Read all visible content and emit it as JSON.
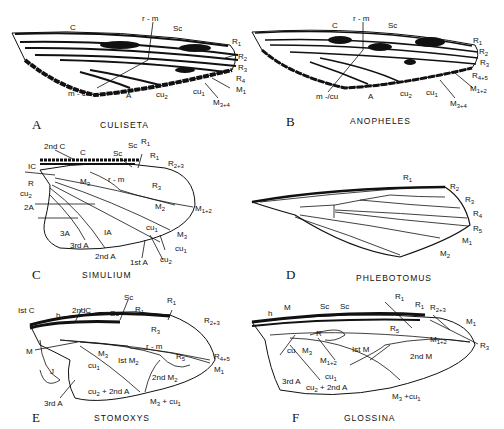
{
  "figure": {
    "panels": [
      {
        "id": "A",
        "letter": "A",
        "genus": "CULISETA",
        "labels": [
          "C",
          "r - m",
          "Sc",
          "R1",
          "R2",
          "R3",
          "R4+5",
          "M1+2",
          "m - cu",
          "A",
          "cu2",
          "cu1",
          "M3+4"
        ]
      },
      {
        "id": "B",
        "letter": "B",
        "genus": "ANOPHELES",
        "labels": [
          "C",
          "r - m",
          "Sc",
          "R1",
          "R2",
          "R3",
          "R4+5",
          "M1+2",
          "m -/cu",
          "A",
          "cu2",
          "cu1",
          "M3+4"
        ]
      },
      {
        "id": "C",
        "letter": "C",
        "genus": "SIMULIUM",
        "labels": [
          "2nd C",
          "C",
          "Sc",
          "Sc",
          "R1",
          "R1",
          "R2+3",
          "IC",
          "R",
          "r - m",
          "M3",
          "R3",
          "cu2",
          "2A",
          "M2",
          "M1+2",
          "3A",
          "IA",
          "cu1",
          "M3",
          "cu1",
          "3rd A",
          "2nd A",
          "1st A",
          "cu2"
        ]
      },
      {
        "id": "D",
        "letter": "D",
        "genus": "PHLEBOTOMUS",
        "labels": [
          "R1",
          "R2",
          "R3",
          "R4",
          "R5",
          "M1",
          "M2"
        ]
      },
      {
        "id": "E",
        "letter": "E",
        "genus": "STOMOXYS",
        "labels": [
          "Ist C",
          "h",
          "2ndC",
          "Sc",
          "Sc",
          "R1",
          "R1",
          "R2+3",
          "R3",
          "r - m",
          "M",
          "M3",
          "Ist M2",
          "R5",
          "R4+5",
          "M1",
          "J",
          "cu1",
          "2nd M2",
          "cu2 + 2nd A",
          "3rd A",
          "M3 + cu1"
        ]
      },
      {
        "id": "F",
        "letter": "F",
        "genus": "GLOSSINA",
        "labels": [
          "h",
          "M",
          "Sc",
          "Sc",
          "R1",
          "R1",
          "R2+3",
          "M1",
          "R",
          "R5",
          "M1+2",
          "R3",
          "cu",
          "M3",
          "Ist M",
          "2nd M",
          "M1+2",
          "cu1",
          "3rd A",
          "cu2 + 2nd A",
          "M3 +cu1"
        ]
      }
    ]
  }
}
